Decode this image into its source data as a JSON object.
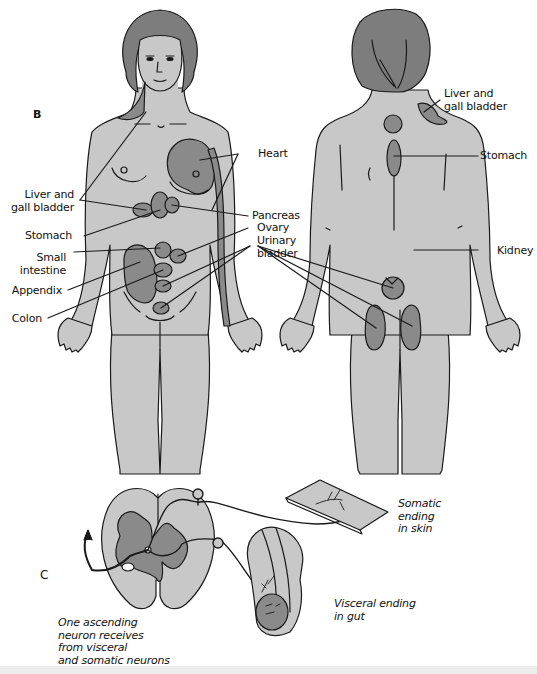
{
  "figure": {
    "panels": [
      {
        "id": "B",
        "label": "B"
      },
      {
        "id": "C",
        "label": "C"
      }
    ],
    "front_view": {
      "left_labels": [
        {
          "text": "Liver and\ngall bladder",
          "lines": [
            "Liver and",
            "gall bladder"
          ]
        },
        {
          "text": "Stomach",
          "lines": [
            "Stomach"
          ]
        },
        {
          "text": "Small\nintestine",
          "lines": [
            "Small",
            "intestine"
          ]
        },
        {
          "text": "Appendix",
          "lines": [
            "Appendix"
          ]
        },
        {
          "text": "Colon",
          "lines": [
            "Colon"
          ]
        }
      ],
      "right_labels": [
        {
          "text": "Heart",
          "lines": [
            "Heart"
          ]
        },
        {
          "text": "Pancreas",
          "lines": [
            "Pancreas"
          ]
        },
        {
          "text": "Ovary",
          "lines": [
            "Ovary"
          ]
        },
        {
          "text": "Urinary\nbladder",
          "lines": [
            "Urinary",
            "bladder"
          ]
        }
      ]
    },
    "back_view": {
      "labels": [
        {
          "text": "Liver and\ngall bladder",
          "lines": [
            "Liver and",
            "gall bladder"
          ]
        },
        {
          "text": "Stomach",
          "lines": [
            "Stomach"
          ]
        },
        {
          "text": "Kidney",
          "lines": [
            "Kidney"
          ]
        }
      ]
    },
    "neuron_diagram": {
      "labels": [
        {
          "text": "Somatic ending in skin",
          "lines": [
            "Somatic",
            "ending",
            "in skin"
          ]
        },
        {
          "text": "Visceral ending in gut",
          "lines": [
            "Visceral ending",
            "in gut"
          ]
        },
        {
          "text": "One ascending neuron receives from visceral and somatic neurons",
          "lines": [
            "One ascending",
            "neuron receives",
            "from visceral",
            "and somatic neurons"
          ]
        }
      ]
    },
    "colors": {
      "skin": "#c8c8c8",
      "organ": "#8a8a8a",
      "hair": "#7d7d7d",
      "outline": "#1a1a1a",
      "background": "#ffffff"
    }
  }
}
